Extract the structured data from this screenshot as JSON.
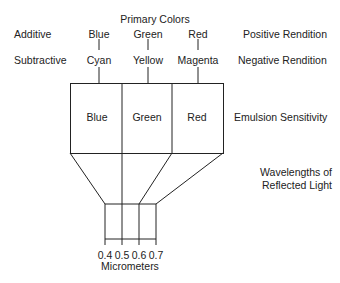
{
  "title": "Primary Colors",
  "rows": {
    "additive": {
      "label": "Additive",
      "colors": [
        "Blue",
        "Green",
        "Red"
      ],
      "rendition": "Positive Rendition"
    },
    "subtractive": {
      "label": "Subtractive",
      "colors": [
        "Cyan",
        "Yellow",
        "Magenta"
      ],
      "rendition": "Negative Rendition"
    }
  },
  "emulsion": {
    "layers": [
      "Blue",
      "Green",
      "Red"
    ],
    "label": "Emulsion Sensitivity"
  },
  "wavelength": {
    "label_line1": "Wavelengths of",
    "label_line2": "Reflected Light"
  },
  "scale": {
    "ticks": [
      "0.4",
      "0.5",
      "0.6",
      "0.7"
    ],
    "unit": "Micrometers"
  },
  "colors": {
    "line": "#222222",
    "text": "#222222",
    "background": "#ffffff"
  }
}
